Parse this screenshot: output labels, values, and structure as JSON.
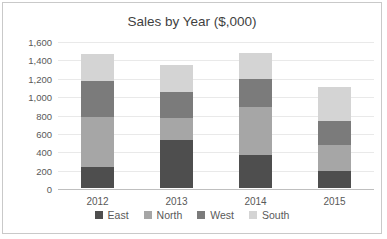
{
  "chart": {
    "title": "Sales by Year ($,000)"
  },
  "chart_data": {
    "type": "bar",
    "stacked": true,
    "title": "Sales by Year ($,000)",
    "xlabel": "",
    "ylabel": "",
    "categories": [
      "2012",
      "2013",
      "2014",
      "2015"
    ],
    "series": [
      {
        "name": "East",
        "color": "#4e4e4e",
        "values": [
          230,
          520,
          355,
          180
        ]
      },
      {
        "name": "North",
        "color": "#a6a6a6",
        "values": [
          540,
          240,
          525,
          285
        ]
      },
      {
        "name": "West",
        "color": "#7b7b7b",
        "values": [
          400,
          280,
          310,
          265
        ]
      },
      {
        "name": "South",
        "color": "#d4d4d4",
        "values": [
          290,
          300,
          275,
          370
        ]
      }
    ],
    "totals": [
      1460,
      1340,
      1465,
      1100
    ],
    "ylim": [
      0,
      1600
    ],
    "ytick_step": 200,
    "y_tick_labels": [
      "0",
      "200",
      "400",
      "600",
      "800",
      "1,000",
      "1,200",
      "1,400",
      "1,600"
    ],
    "grid": true,
    "legend_position": "bottom",
    "axis_color": "#bfbfbf",
    "gridline_color": "#e9e9e9",
    "text_color": "#595959",
    "title_color": "#3f3f3f"
  }
}
